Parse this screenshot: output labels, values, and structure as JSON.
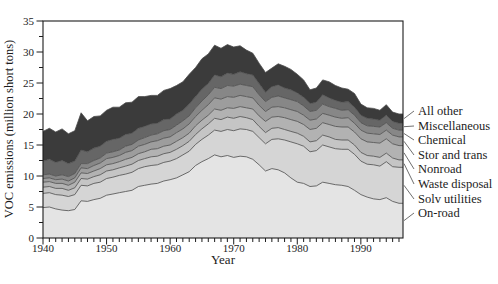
{
  "figure": {
    "background": "#ffffff",
    "text_color": "#1c1c1c",
    "box_color": "#1c1c1c",
    "boundary_line_color": "#4a4a4a"
  },
  "chart_data": {
    "type": "area",
    "stacked": true,
    "title": "",
    "xlabel": "Year",
    "ylabel": "VOC emissions (million short tons)",
    "xlim": [
      1940,
      1996.7
    ],
    "ylim": [
      0,
      35
    ],
    "grid": false,
    "legend_position": "right-outside",
    "yticks_major": [
      0,
      5,
      10,
      15,
      20,
      25,
      30,
      35
    ],
    "ytick_minor_step": 2.5,
    "xticks_major": [
      1940,
      1950,
      1960,
      1970,
      1980,
      1990
    ],
    "xtick_minor_step": 1,
    "x": [
      1940,
      1941,
      1942,
      1943,
      1944,
      1945,
      1946,
      1947,
      1948,
      1949,
      1950,
      1951,
      1952,
      1953,
      1954,
      1955,
      1956,
      1957,
      1958,
      1959,
      1960,
      1961,
      1962,
      1963,
      1964,
      1965,
      1966,
      1967,
      1968,
      1969,
      1970,
      1971,
      1972,
      1973,
      1974,
      1975,
      1976,
      1977,
      1978,
      1979,
      1980,
      1981,
      1982,
      1983,
      1984,
      1985,
      1986,
      1987,
      1988,
      1989,
      1990,
      1991,
      1992,
      1993,
      1994,
      1995,
      1996
    ],
    "series": [
      {
        "name": "On-road",
        "color": "#e4e4e4",
        "values": [
          4.9,
          5.0,
          4.7,
          4.5,
          4.4,
          4.6,
          6.0,
          5.9,
          6.2,
          6.4,
          6.9,
          7.1,
          7.3,
          7.5,
          7.7,
          8.3,
          8.5,
          8.7,
          8.8,
          9.2,
          9.4,
          9.7,
          10.2,
          10.7,
          11.7,
          12.3,
          12.8,
          13.4,
          13.1,
          13.3,
          13.0,
          13.2,
          13.1,
          12.7,
          11.8,
          10.8,
          11.2,
          11.0,
          10.5,
          9.7,
          9.0,
          8.8,
          8.3,
          8.4,
          9.0,
          8.8,
          8.6,
          8.5,
          8.3,
          7.7,
          7.0,
          6.6,
          6.3,
          6.2,
          6.5,
          5.9,
          5.6
        ]
      },
      {
        "name": "Solv utilities",
        "color": "#d5d5d5",
        "values": [
          2.3,
          2.3,
          2.3,
          2.4,
          2.3,
          2.4,
          2.5,
          2.5,
          2.6,
          2.6,
          2.7,
          2.7,
          2.8,
          2.8,
          2.9,
          2.9,
          3.0,
          3.0,
          3.0,
          3.0,
          3.0,
          3.1,
          3.2,
          3.3,
          3.4,
          3.6,
          3.8,
          4.0,
          4.1,
          4.2,
          4.3,
          4.4,
          4.4,
          4.5,
          4.4,
          4.4,
          4.7,
          5.0,
          5.3,
          5.8,
          6.2,
          6.0,
          5.6,
          5.7,
          6.0,
          5.9,
          5.8,
          5.8,
          6.0,
          5.8,
          5.4,
          5.3,
          5.5,
          5.4,
          5.8,
          5.6,
          5.8
        ]
      },
      {
        "name": "Waste disposal",
        "color": "#c5c5c5",
        "values": [
          1.0,
          1.0,
          1.0,
          1.1,
          1.0,
          1.1,
          1.1,
          1.1,
          1.1,
          1.2,
          1.2,
          1.2,
          1.2,
          1.3,
          1.3,
          1.3,
          1.3,
          1.4,
          1.4,
          1.4,
          1.4,
          1.5,
          1.5,
          1.6,
          1.6,
          1.7,
          1.8,
          1.9,
          1.9,
          2.0,
          2.0,
          2.0,
          1.9,
          1.9,
          1.8,
          1.8,
          1.8,
          1.8,
          1.7,
          1.7,
          1.7,
          1.6,
          1.6,
          1.6,
          1.6,
          1.6,
          1.5,
          1.5,
          1.5,
          1.5,
          1.4,
          1.4,
          1.4,
          1.4,
          1.4,
          1.4,
          1.2
        ]
      },
      {
        "name": "Nonroad",
        "color": "#b2b2b2",
        "values": [
          0.8,
          0.8,
          0.8,
          0.8,
          0.8,
          0.9,
          0.9,
          0.9,
          0.9,
          1.0,
          1.0,
          1.0,
          1.0,
          1.1,
          1.1,
          1.1,
          1.1,
          1.2,
          1.2,
          1.2,
          1.2,
          1.3,
          1.3,
          1.3,
          1.4,
          1.4,
          1.4,
          1.5,
          1.5,
          1.5,
          1.6,
          1.6,
          1.6,
          1.7,
          1.7,
          1.8,
          1.8,
          1.8,
          1.9,
          1.9,
          1.9,
          1.9,
          2.0,
          2.0,
          2.0,
          2.0,
          2.1,
          2.1,
          2.1,
          2.1,
          2.2,
          2.2,
          2.2,
          2.3,
          2.3,
          2.3,
          2.3
        ]
      },
      {
        "name": "Stor and trans",
        "color": "#9d9d9d",
        "values": [
          0.6,
          0.6,
          0.6,
          0.7,
          0.7,
          0.7,
          0.8,
          0.8,
          0.9,
          0.9,
          1.0,
          1.0,
          1.0,
          1.1,
          1.1,
          1.2,
          1.2,
          1.2,
          1.3,
          1.3,
          1.3,
          1.4,
          1.4,
          1.5,
          1.5,
          1.6,
          1.7,
          1.8,
          1.8,
          1.8,
          1.8,
          1.8,
          1.8,
          1.8,
          1.7,
          1.6,
          1.6,
          1.6,
          1.6,
          1.6,
          1.6,
          1.5,
          1.5,
          1.5,
          1.5,
          1.5,
          1.5,
          1.4,
          1.5,
          1.4,
          1.4,
          1.4,
          1.4,
          1.4,
          1.4,
          1.4,
          1.4
        ]
      },
      {
        "name": "Chemical",
        "color": "#878787",
        "values": [
          0.6,
          0.6,
          0.6,
          0.7,
          0.7,
          0.7,
          0.7,
          0.8,
          0.8,
          0.8,
          0.9,
          0.9,
          0.9,
          1.0,
          1.0,
          1.0,
          1.1,
          1.1,
          1.1,
          1.2,
          1.2,
          1.2,
          1.3,
          1.3,
          1.4,
          1.5,
          1.6,
          1.7,
          1.7,
          1.8,
          1.8,
          1.8,
          1.8,
          1.8,
          1.7,
          1.6,
          1.6,
          1.7,
          1.6,
          1.6,
          1.6,
          1.5,
          1.4,
          1.4,
          1.5,
          1.4,
          1.4,
          1.3,
          1.3,
          1.3,
          1.2,
          1.2,
          1.2,
          1.2,
          1.2,
          1.1,
          1.1
        ]
      },
      {
        "name": "Miscellaneous",
        "color": "#666666",
        "values": [
          2.2,
          2.4,
          2.2,
          2.3,
          2.1,
          2.0,
          2.2,
          1.9,
          2.0,
          1.9,
          1.9,
          2.0,
          1.9,
          1.9,
          1.8,
          1.9,
          1.8,
          1.8,
          1.7,
          1.8,
          1.7,
          1.8,
          1.7,
          1.9,
          1.8,
          1.9,
          1.8,
          2.0,
          1.9,
          2.0,
          1.9,
          2.0,
          1.9,
          1.9,
          1.8,
          1.5,
          1.7,
          1.8,
          1.6,
          1.6,
          1.4,
          1.4,
          1.3,
          1.3,
          1.5,
          1.4,
          1.3,
          1.3,
          1.3,
          1.3,
          1.2,
          1.2,
          1.2,
          1.1,
          1.2,
          1.1,
          1.1
        ]
      },
      {
        "name": "All other",
        "color": "#3b3b3b",
        "values": [
          4.8,
          5.0,
          4.9,
          5.1,
          4.8,
          4.9,
          6.0,
          5.0,
          5.1,
          4.9,
          5.0,
          5.2,
          5.0,
          5.1,
          5.0,
          5.1,
          4.8,
          4.6,
          4.5,
          4.7,
          4.9,
          4.6,
          4.6,
          4.8,
          4.7,
          4.9,
          4.8,
          4.8,
          4.6,
          4.6,
          4.4,
          4.2,
          3.8,
          3.5,
          3.3,
          3.2,
          3.0,
          3.4,
          3.5,
          3.3,
          3.0,
          2.8,
          2.2,
          2.3,
          2.4,
          2.6,
          2.4,
          2.3,
          2.0,
          2.2,
          1.8,
          1.7,
          1.7,
          1.6,
          1.7,
          1.5,
          1.5
        ]
      }
    ],
    "legend_labels_top_to_bottom": [
      "All other",
      "Miscellaneous",
      "Chemical",
      "Stor and trans",
      "Nonroad",
      "Waste disposal",
      "Solv utilities",
      "On-road"
    ]
  }
}
